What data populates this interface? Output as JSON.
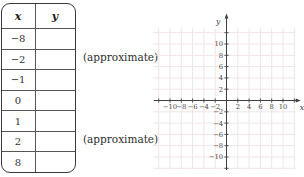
{
  "table": {
    "headers": [
      "x",
      "y"
    ],
    "rows": [
      {
        "x": "-8",
        "y": ""
      },
      {
        "x": "-2",
        "y": ""
      },
      {
        "x": "-1",
        "y": ""
      },
      {
        "x": "0",
        "y": ""
      },
      {
        "x": "1",
        "y": ""
      },
      {
        "x": "2",
        "y": ""
      },
      {
        "x": "8",
        "y": ""
      }
    ]
  },
  "annotations": [
    "(approximate)",
    "(approximate)"
  ],
  "chart_data": {
    "type": "scatter",
    "title": "",
    "xlabel": "x",
    "ylabel": "y",
    "xlim": [
      -12,
      12
    ],
    "ylim": [
      -12,
      12
    ],
    "tick_step": 2,
    "xticks": [
      -10,
      -8,
      -6,
      -4,
      -2,
      2,
      4,
      6,
      8,
      10
    ],
    "yticks": [
      -10,
      -8,
      -6,
      -4,
      -2,
      2,
      4,
      6,
      8,
      10
    ],
    "grid": true,
    "grid_color": "#f1e4e7",
    "axis_color": "#3f3f3f",
    "label_color": "#4a4a4a",
    "series": []
  }
}
